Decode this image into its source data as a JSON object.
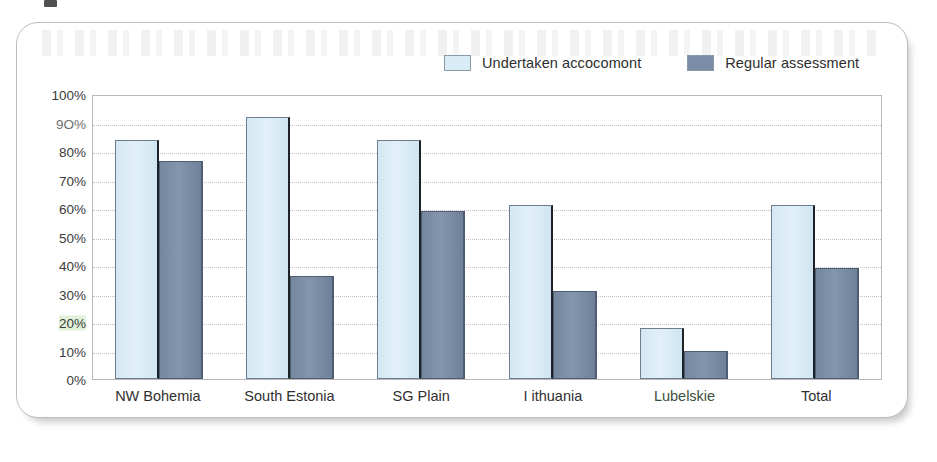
{
  "chart_data": {
    "type": "bar",
    "title": "",
    "xlabel": "",
    "ylabel": "",
    "ylim": [
      0,
      100
    ],
    "grid": true,
    "legend_position": "top",
    "categories": [
      "NW Bohemia",
      "South Estonia",
      "SG Plain",
      "I ithuania",
      "Lubelskie",
      "Total"
    ],
    "ytick_labels": [
      "100%",
      "9O%",
      "80%",
      "70%",
      "60%",
      "50%",
      "40%",
      "30%",
      "20%",
      "10%",
      "0%"
    ],
    "ytick_values": [
      100,
      90,
      80,
      70,
      60,
      50,
      40,
      30,
      20,
      10,
      0
    ],
    "series": [
      {
        "name": "Undertaken accocomont",
        "color": "#d9ecf5",
        "values": [
          84,
          92,
          84,
          61,
          18,
          61
        ]
      },
      {
        "name": "Regular assessment",
        "color": "#7b8ea8",
        "values": [
          76.5,
          36,
          59,
          31,
          10,
          39
        ]
      }
    ]
  },
  "legend": {
    "items": [
      {
        "label": "Undertaken accocomont",
        "swatch": "light"
      },
      {
        "label": "Regular assessment",
        "swatch": "dark"
      }
    ]
  }
}
